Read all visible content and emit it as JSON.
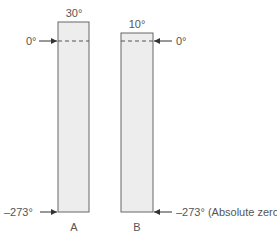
{
  "diagram": {
    "columns": [
      {
        "name": "A",
        "top_label": "30°",
        "zero_label": "0°",
        "bottom_label": "–273°"
      },
      {
        "name": "B",
        "top_label": "10°",
        "zero_label": "0°",
        "bottom_label": "–273° (Absolute zero)"
      }
    ],
    "colors": {
      "fill": "#ededed",
      "stroke": "#666666",
      "text": "#555555"
    }
  }
}
